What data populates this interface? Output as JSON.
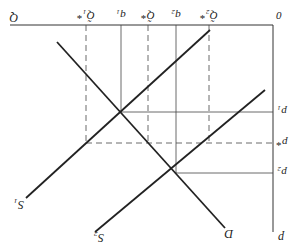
{
  "diagram": {
    "orientation": "rotated-180",
    "axes": {
      "origin_label": "0",
      "quantity_axis_label": "Q",
      "price_axis_label": "p"
    },
    "quantity_ticks": [
      {
        "label": "Q̃₂*",
        "style": "dashed"
      },
      {
        "label": "q₂",
        "style": "solid"
      },
      {
        "label": "Q̃*",
        "style": "dashed"
      },
      {
        "label": "q₁",
        "style": "solid"
      },
      {
        "label": "Q̃₁*",
        "style": "dashed"
      }
    ],
    "price_ticks": [
      {
        "label": "p₁",
        "style": "solid"
      },
      {
        "label": "p*",
        "style": "dashed"
      },
      {
        "label": "p₂",
        "style": "solid"
      }
    ],
    "curves": [
      {
        "label": "D",
        "type": "demand"
      },
      {
        "label": "S₁",
        "type": "supply"
      },
      {
        "label": "S₂",
        "type": "supply"
      }
    ],
    "line_color": "#222222"
  }
}
